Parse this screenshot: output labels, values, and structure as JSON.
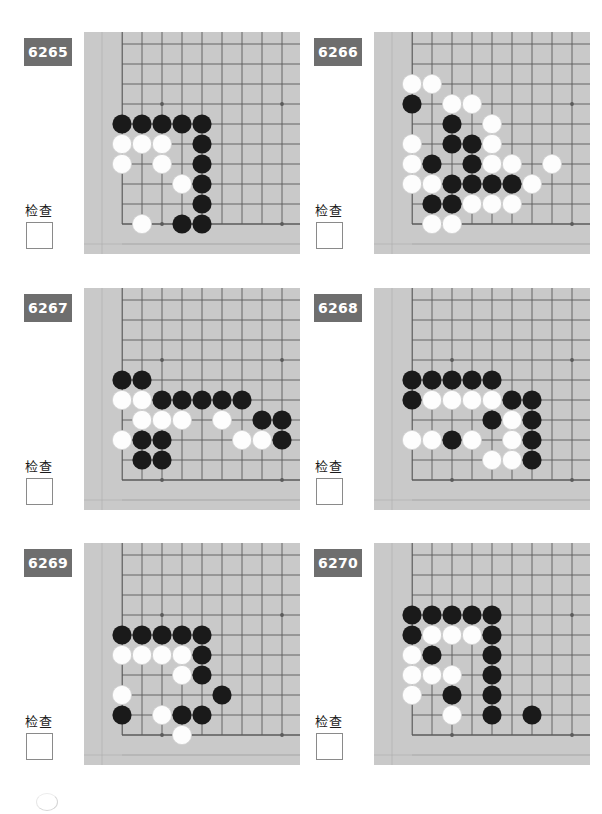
{
  "page": {
    "check_label": "检查",
    "badge_color": "#6e6e6e",
    "board_bg": "#c9c9c9",
    "grid_color": "#5a5a5a",
    "black_color": "#1a1a1a",
    "white_color": "#fdfdfd"
  },
  "board": {
    "cell": 20,
    "cols": 10,
    "rows": 10,
    "origin_x": 18,
    "origin_y": 12,
    "stone_radius": 9.6,
    "star_points": [
      [
        3,
        3
      ],
      [
        9,
        3
      ],
      [
        3,
        9
      ],
      [
        9,
        9
      ]
    ],
    "edges": {
      "left": 1,
      "bottom": 9
    }
  },
  "problems": [
    {
      "id": "6265",
      "number": "6265",
      "check_label": "检查",
      "black": [
        [
          1,
          4
        ],
        [
          2,
          4
        ],
        [
          3,
          4
        ],
        [
          4,
          4
        ],
        [
          5,
          4
        ],
        [
          5,
          5
        ],
        [
          5,
          6
        ],
        [
          5,
          7
        ],
        [
          5,
          8
        ],
        [
          4,
          9
        ],
        [
          5,
          9
        ]
      ],
      "white": [
        [
          1,
          5
        ],
        [
          2,
          5
        ],
        [
          3,
          5
        ],
        [
          1,
          6
        ],
        [
          3,
          6
        ],
        [
          4,
          7
        ],
        [
          2,
          9
        ]
      ]
    },
    {
      "id": "6266",
      "number": "6266",
      "check_label": "检查",
      "black": [
        [
          1,
          3
        ],
        [
          3,
          4
        ],
        [
          3,
          5
        ],
        [
          4,
          5
        ],
        [
          2,
          6
        ],
        [
          4,
          6
        ],
        [
          3,
          7
        ],
        [
          4,
          7
        ],
        [
          5,
          7
        ],
        [
          6,
          7
        ],
        [
          2,
          8
        ],
        [
          3,
          8
        ]
      ],
      "white": [
        [
          1,
          2
        ],
        [
          2,
          2
        ],
        [
          3,
          3
        ],
        [
          4,
          3
        ],
        [
          5,
          4
        ],
        [
          1,
          5
        ],
        [
          5,
          5
        ],
        [
          1,
          6
        ],
        [
          5,
          6
        ],
        [
          6,
          6
        ],
        [
          8,
          6
        ],
        [
          1,
          7
        ],
        [
          2,
          7
        ],
        [
          7,
          7
        ],
        [
          4,
          8
        ],
        [
          5,
          8
        ],
        [
          6,
          8
        ],
        [
          2,
          9
        ],
        [
          3,
          9
        ]
      ]
    },
    {
      "id": "6267",
      "number": "6267",
      "check_label": "检查",
      "black": [
        [
          1,
          4
        ],
        [
          2,
          4
        ],
        [
          3,
          5
        ],
        [
          4,
          5
        ],
        [
          5,
          5
        ],
        [
          6,
          5
        ],
        [
          7,
          5
        ],
        [
          8,
          6
        ],
        [
          9,
          6
        ],
        [
          2,
          7
        ],
        [
          3,
          7
        ],
        [
          9,
          7
        ],
        [
          2,
          8
        ],
        [
          3,
          8
        ]
      ],
      "white": [
        [
          1,
          5
        ],
        [
          2,
          5
        ],
        [
          2,
          6
        ],
        [
          3,
          6
        ],
        [
          4,
          6
        ],
        [
          6,
          6
        ],
        [
          1,
          7
        ],
        [
          7,
          7
        ],
        [
          8,
          7
        ]
      ]
    },
    {
      "id": "6268",
      "number": "6268",
      "check_label": "检查",
      "black": [
        [
          1,
          4
        ],
        [
          2,
          4
        ],
        [
          3,
          4
        ],
        [
          4,
          4
        ],
        [
          5,
          4
        ],
        [
          1,
          5
        ],
        [
          6,
          5
        ],
        [
          7,
          5
        ],
        [
          5,
          6
        ],
        [
          7,
          6
        ],
        [
          3,
          7
        ],
        [
          7,
          7
        ],
        [
          7,
          8
        ]
      ],
      "white": [
        [
          2,
          5
        ],
        [
          3,
          5
        ],
        [
          4,
          5
        ],
        [
          5,
          5
        ],
        [
          6,
          6
        ],
        [
          1,
          7
        ],
        [
          2,
          7
        ],
        [
          4,
          7
        ],
        [
          6,
          7
        ],
        [
          5,
          8
        ],
        [
          6,
          8
        ]
      ]
    },
    {
      "id": "6269",
      "number": "6269",
      "check_label": "检查",
      "black": [
        [
          1,
          4
        ],
        [
          2,
          4
        ],
        [
          3,
          4
        ],
        [
          4,
          4
        ],
        [
          5,
          4
        ],
        [
          5,
          5
        ],
        [
          5,
          6
        ],
        [
          6,
          7
        ],
        [
          1,
          8
        ],
        [
          4,
          8
        ],
        [
          5,
          8
        ]
      ],
      "white": [
        [
          1,
          5
        ],
        [
          2,
          5
        ],
        [
          3,
          5
        ],
        [
          4,
          5
        ],
        [
          4,
          6
        ],
        [
          1,
          7
        ],
        [
          3,
          8
        ],
        [
          4,
          9
        ]
      ]
    },
    {
      "id": "6270",
      "number": "6270",
      "check_label": "检查",
      "black": [
        [
          1,
          3
        ],
        [
          2,
          3
        ],
        [
          3,
          3
        ],
        [
          4,
          3
        ],
        [
          5,
          3
        ],
        [
          1,
          4
        ],
        [
          5,
          4
        ],
        [
          2,
          5
        ],
        [
          5,
          5
        ],
        [
          5,
          6
        ],
        [
          3,
          7
        ],
        [
          5,
          7
        ],
        [
          5,
          8
        ],
        [
          7,
          8
        ]
      ],
      "white": [
        [
          2,
          4
        ],
        [
          3,
          4
        ],
        [
          4,
          4
        ],
        [
          1,
          5
        ],
        [
          1,
          6
        ],
        [
          2,
          6
        ],
        [
          3,
          6
        ],
        [
          1,
          7
        ],
        [
          3,
          8
        ]
      ]
    }
  ]
}
